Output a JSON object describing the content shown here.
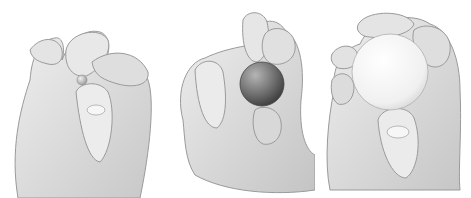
{
  "figure": {
    "panels": [
      {
        "object": "small bead",
        "sphere_color": "#bdbdbd",
        "grip": "tip pinch"
      },
      {
        "object": "medium dark ball",
        "sphere_color": "#6a6a6a",
        "grip": "three-finger pinch"
      },
      {
        "object": "large white ball",
        "sphere_color": "#f4f4f4",
        "grip": "spherical grasp"
      }
    ],
    "colors": {
      "background": "#ffffff",
      "skin_light": "#e6e6e6",
      "skin_mid": "#cfcfcf",
      "outline": "#9a9a9a"
    }
  }
}
